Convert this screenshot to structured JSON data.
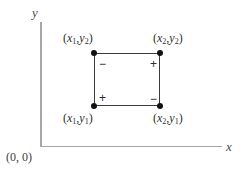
{
  "figure": {
    "background_color": "#ffffff",
    "axis_color": "#a6a6a6",
    "rect_stroke_color": "#3b3b3b",
    "vertex_color": "#111111",
    "width": 250,
    "height": 171
  },
  "axes": {
    "y_label": "y",
    "x_label": "x",
    "origin_label": "(0, 0)"
  },
  "rectangle": {
    "corners": [
      {
        "id": "top-left",
        "label_parts": {
          "open": "(",
          "x_var": "x",
          "x_sub": "1",
          "comma": ",",
          "y_var": "y",
          "y_sub": "2",
          "close": ")"
        },
        "label_text": "(x1, y2)",
        "sign": "−"
      },
      {
        "id": "top-right",
        "label_parts": {
          "open": "(",
          "x_var": "x",
          "x_sub": "2",
          "comma": ",",
          "y_var": "y",
          "y_sub": "2",
          "close": ")"
        },
        "label_text": "(x2, y2)",
        "sign": "+"
      },
      {
        "id": "bottom-left",
        "label_parts": {
          "open": "(",
          "x_var": "x",
          "x_sub": "1",
          "comma": ",",
          "y_var": "y",
          "y_sub": "1",
          "close": ")"
        },
        "label_text": "(x1, y1)",
        "sign": "+"
      },
      {
        "id": "bottom-right",
        "label_parts": {
          "open": "(",
          "x_var": "x",
          "x_sub": "2",
          "comma": ",",
          "y_var": "y",
          "y_sub": "1",
          "close": ")"
        },
        "label_text": "(x2, y1)",
        "sign": "−"
      }
    ]
  },
  "chart_data": {
    "type": "scatter",
    "title": "",
    "xlabel": "x",
    "ylabel": "y",
    "grid": false,
    "legend": "none",
    "annotations": [
      {
        "text": "(0, 0)",
        "role": "origin-label"
      },
      {
        "text": "−",
        "role": "corner-sign-top-left"
      },
      {
        "text": "+",
        "role": "corner-sign-top-right"
      },
      {
        "text": "+",
        "role": "corner-sign-bottom-left"
      },
      {
        "text": "−",
        "role": "corner-sign-bottom-right"
      }
    ],
    "points": [
      {
        "label": "(x1, y2)",
        "corner": "top-left",
        "sign": "−"
      },
      {
        "label": "(x2, y2)",
        "corner": "top-right",
        "sign": "+"
      },
      {
        "label": "(x1, y1)",
        "corner": "bottom-left",
        "sign": "+"
      },
      {
        "label": "(x2, y1)",
        "corner": "bottom-right",
        "sign": "−"
      }
    ],
    "shapes": [
      {
        "type": "rectangle",
        "corners": [
          "(x1, y1)",
          "(x2, y1)",
          "(x2, y2)",
          "(x1, y2)"
        ]
      }
    ]
  }
}
